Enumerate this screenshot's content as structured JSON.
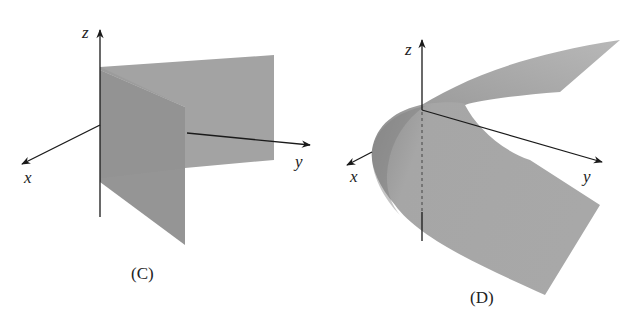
{
  "figures": [
    {
      "id": "C",
      "caption": "(C)",
      "axes": {
        "x": "x",
        "y": "y",
        "z": "z"
      },
      "description": "Two intersecting vertical planes"
    },
    {
      "id": "D",
      "caption": "(D)",
      "axes": {
        "x": "x",
        "y": "y",
        "z": "z"
      },
      "description": "Parabolic cylinder surface"
    }
  ],
  "colors": {
    "surface": "#9a9a9a",
    "surface_light": "#b5b5b5",
    "axis": "#1a1a1a",
    "background": "#ffffff"
  }
}
